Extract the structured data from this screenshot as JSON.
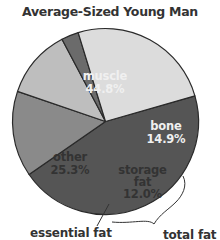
{
  "chart_data": {
    "type": "pie",
    "title": "Average-Sized Young Man",
    "start_angle_deg": 16,
    "direction": "clockwise",
    "slices": [
      {
        "label": "muscle",
        "value": 44.8,
        "display": "44.8%",
        "color": "#555555",
        "text_color": "#f0f0f0"
      },
      {
        "label": "bone",
        "value": 14.9,
        "display": "14.9%",
        "color": "#8a8a8a",
        "text_color": "#f0f0f0"
      },
      {
        "label": "storage fat",
        "value": 12.0,
        "display": "12.0%",
        "color": "#bebebe",
        "text_color": "#333333"
      },
      {
        "label": "essential fat",
        "value": 3.0,
        "display": "",
        "color": "#6b6b6b",
        "text_color": "#333333"
      },
      {
        "label": "other",
        "value": 25.3,
        "display": "25.3%",
        "color": "#dcdcdc",
        "text_color": "#333333"
      }
    ],
    "annotations": [
      {
        "text": "essential fat",
        "points_to": "essential fat"
      },
      {
        "text": "total fat",
        "spans": [
          "storage fat",
          "essential fat"
        ]
      }
    ],
    "legend": "none"
  },
  "labels": {
    "title": "Average-Sized Young Man",
    "muscle_name": "muscle",
    "muscle_pct": "44.8%",
    "bone_name": "bone",
    "bone_pct": "14.9%",
    "storage_name_1": "storage",
    "storage_name_2": "fat",
    "storage_pct": "12.0%",
    "other_name": "other",
    "other_pct": "25.3%",
    "essential_fat": "essential fat",
    "total_fat": "total fat"
  }
}
